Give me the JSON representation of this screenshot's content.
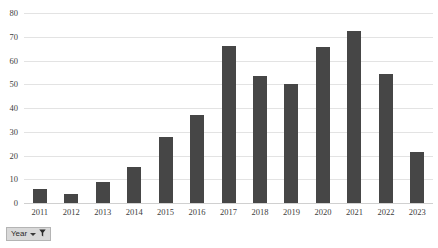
{
  "chart_data": {
    "type": "bar",
    "title": "",
    "xlabel": "",
    "ylabel": "",
    "ylim": [
      0,
      80
    ],
    "ytick_step": 10,
    "yticks": [
      80,
      70,
      60,
      50,
      40,
      30,
      20,
      10,
      0
    ],
    "grid": true,
    "legend": "none",
    "bar_color": "#464646",
    "gridline_color": "#e3e3e3",
    "categories": [
      "2011",
      "2012",
      "2013",
      "2014",
      "2015",
      "2016",
      "2017",
      "2018",
      "2019",
      "2020",
      "2021",
      "2022",
      "2023"
    ],
    "values": [
      6,
      4,
      9,
      15,
      28,
      37,
      66,
      53.5,
      50,
      65.5,
      72.5,
      54.5,
      21.5
    ],
    "series": [
      {
        "name": "Publications",
        "values": [
          6,
          4,
          9,
          15,
          28,
          37,
          66,
          53.5,
          50,
          65.5,
          72.5,
          54.5,
          21.5
        ]
      }
    ]
  },
  "filter": {
    "label": "Year",
    "caret_icon": "chevron-down-icon",
    "funnel_icon": "funnel-filter-icon"
  }
}
